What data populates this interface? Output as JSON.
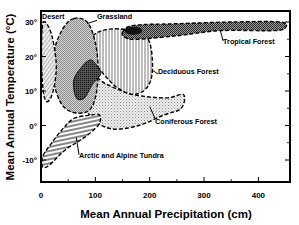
{
  "chart_data": {
    "type": "area",
    "title": "",
    "xlabel": "Mean Annual Precipitation (cm)",
    "ylabel": "Mean Annual Temperature (°C)",
    "xlim": [
      0,
      457
    ],
    "ylim": [
      -16,
      33
    ],
    "x_ticks": [
      {
        "value": 0,
        "label": "0"
      },
      {
        "value": 100,
        "label": "100"
      },
      {
        "value": 200,
        "label": "200"
      },
      {
        "value": 300,
        "label": "300"
      },
      {
        "value": 400,
        "label": "400"
      }
    ],
    "x_minor_ticks": [
      50,
      150,
      250,
      350
    ],
    "y_ticks": [
      {
        "value": 30,
        "label": "30°"
      },
      {
        "value": 20,
        "label": "20°"
      },
      {
        "value": 10,
        "label": "10°"
      },
      {
        "value": 0,
        "label": "0°"
      },
      {
        "value": -10,
        "label": "-10°"
      }
    ],
    "y_minor_ticks_right": [
      25,
      15,
      5,
      -5
    ],
    "grid": false,
    "legend": "none (regions labeled directly)",
    "series": [
      {
        "name": "Desert",
        "pattern": "diagonal-hatch-light",
        "fill_color": "#bdbdbd",
        "approx_extent": {
          "precip_cm": [
            0,
            30
          ],
          "temp_c": [
            7,
            30
          ]
        },
        "outline": [
          [
            2,
            28
          ],
          [
            8,
            30
          ],
          [
            20,
            26
          ],
          [
            28,
            18
          ],
          [
            25,
            12
          ],
          [
            18,
            8
          ],
          [
            10,
            7
          ],
          [
            4,
            10
          ],
          [
            1,
            18
          ]
        ],
        "label_pos": [
          2,
          31
        ]
      },
      {
        "name": "Grassland",
        "pattern": "checker-gray",
        "fill_color": "#c8c8c8",
        "approx_extent": {
          "precip_cm": [
            20,
            110
          ],
          "temp_c": [
            4,
            31
          ]
        },
        "outline": [
          [
            60,
            31
          ],
          [
            85,
            30
          ],
          [
            100,
            24
          ],
          [
            105,
            16
          ],
          [
            100,
            8
          ],
          [
            85,
            4
          ],
          [
            55,
            4
          ],
          [
            35,
            7
          ],
          [
            22,
            14
          ],
          [
            25,
            22
          ],
          [
            40,
            28
          ]
        ],
        "label_pos": [
          103,
          31
        ]
      },
      {
        "name": "Tropical Forest",
        "pattern": "crosshatch-dark",
        "fill_color": "#8a8a8a",
        "approx_extent": {
          "precip_cm": [
            150,
            450
          ],
          "temp_c": [
            25,
            30
          ]
        },
        "outline": [
          [
            150,
            27
          ],
          [
            170,
            29
          ],
          [
            250,
            29.5
          ],
          [
            350,
            30
          ],
          [
            440,
            30
          ],
          [
            450,
            28.5
          ],
          [
            430,
            27.5
          ],
          [
            330,
            27.5
          ],
          [
            250,
            26
          ],
          [
            175,
            25
          ],
          [
            155,
            25.5
          ]
        ],
        "label_pos": [
          335,
          23.5
        ]
      },
      {
        "name": "Deciduous Forest",
        "pattern": "vertical-lines",
        "fill_color": "#ffffff",
        "approx_extent": {
          "precip_cm": [
            55,
            205
          ],
          "temp_c": [
            7,
            28
          ]
        },
        "outline": [
          [
            95,
            26
          ],
          [
            130,
            28
          ],
          [
            180,
            27
          ],
          [
            200,
            24
          ],
          [
            205,
            16
          ],
          [
            195,
            11
          ],
          [
            170,
            9
          ],
          [
            140,
            11
          ],
          [
            120,
            14
          ],
          [
            100,
            17
          ],
          [
            80,
            13
          ],
          [
            65,
            9
          ],
          [
            60,
            14
          ],
          [
            70,
            20
          ]
        ],
        "label_pos": [
          215,
          15
        ]
      },
      {
        "name": "Coniferous Forest",
        "pattern": "fine-dot-gray",
        "fill_color": "#e0e0e0",
        "approx_extent": {
          "precip_cm": [
            40,
            265
          ],
          "temp_c": [
            -1,
            17
          ]
        },
        "outline": [
          [
            95,
            15
          ],
          [
            120,
            12
          ],
          [
            170,
            9
          ],
          [
            230,
            8
          ],
          [
            262,
            9
          ],
          [
            258,
            5
          ],
          [
            225,
            3
          ],
          [
            180,
            0
          ],
          [
            130,
            -1
          ],
          [
            95,
            2
          ],
          [
            75,
            7
          ],
          [
            60,
            13
          ],
          [
            70,
            16
          ]
        ],
        "label_pos": [
          210,
          0.5
        ]
      },
      {
        "name": "Arctic and Alpine Tundra",
        "pattern": "horizontal-lines",
        "fill_color": "#ffffff",
        "approx_extent": {
          "precip_cm": [
            0,
            110
          ],
          "temp_c": [
            -12,
            3
          ]
        },
        "outline": [
          [
            60,
            2
          ],
          [
            90,
            3
          ],
          [
            108,
            3
          ],
          [
            105,
            0
          ],
          [
            75,
            -4
          ],
          [
            45,
            -7
          ],
          [
            15,
            -11.5
          ],
          [
            3,
            -12
          ],
          [
            3,
            -9
          ],
          [
            20,
            -5
          ],
          [
            40,
            -1
          ]
        ],
        "label_pos": [
          70,
          -9.5
        ]
      }
    ],
    "overlap_region": {
      "name": "Desert/Grassland/Deciduous overlap (dark)",
      "fill_color": "#333333",
      "outline": [
        [
          60,
          13
        ],
        [
          75,
          17
        ],
        [
          90,
          19
        ],
        [
          100,
          18
        ],
        [
          110,
          15
        ],
        [
          95,
          12
        ],
        [
          80,
          8
        ],
        [
          65,
          8
        ]
      ]
    }
  }
}
